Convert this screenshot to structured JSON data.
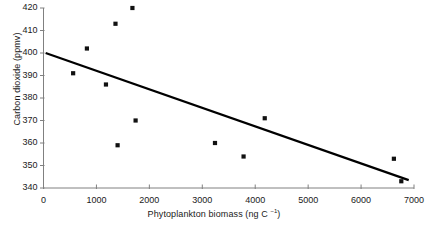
{
  "chart_data": {
    "type": "scatter",
    "title": "",
    "xlabel": "Phytoplankton biomass (ng C l⁻¹)",
    "xlabel_main": "Phytoplankton biomass (ng C ",
    "xlabel_sup": "−1",
    "xlabel_tail": ")",
    "ylabel": "Carbon dioxide (ppmv)",
    "xlim": [
      0,
      7000
    ],
    "ylim": [
      340,
      420
    ],
    "xticks": [
      0,
      1000,
      2000,
      3000,
      4000,
      5000,
      6000,
      7000
    ],
    "xtick_labels": [
      "0",
      "1000",
      "2000",
      "3000",
      "4000",
      "5000",
      "6000",
      "7000"
    ],
    "yticks": [
      340,
      350,
      360,
      370,
      380,
      390,
      400,
      410,
      420
    ],
    "ytick_labels": [
      "340",
      "350",
      "360",
      "370",
      "380",
      "390",
      "400",
      "410",
      "420"
    ],
    "grid": false,
    "legend": "none",
    "marker": "square",
    "marker_color": "#111111",
    "axis_color": "#808080",
    "trendline": {
      "type": "linear",
      "color": "#000000",
      "width": 2.2,
      "x_start": 40,
      "y_start": 400,
      "x_end": 6900,
      "y_end": 343.5
    },
    "points": [
      {
        "x": 560,
        "y": 391
      },
      {
        "x": 820,
        "y": 402
      },
      {
        "x": 1180,
        "y": 386
      },
      {
        "x": 1360,
        "y": 413
      },
      {
        "x": 1400,
        "y": 359
      },
      {
        "x": 1680,
        "y": 420
      },
      {
        "x": 1740,
        "y": 370
      },
      {
        "x": 3240,
        "y": 360
      },
      {
        "x": 3780,
        "y": 354
      },
      {
        "x": 4180,
        "y": 371
      },
      {
        "x": 6620,
        "y": 353
      },
      {
        "x": 6760,
        "y": 343
      }
    ]
  }
}
